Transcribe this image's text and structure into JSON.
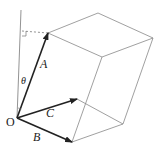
{
  "diagram": {
    "title": "",
    "colors": {
      "edge": "#888888",
      "vector": "#222222",
      "axis": "#777777",
      "background": "#ffffff"
    },
    "labels": {
      "origin": "O",
      "vector_a": "A",
      "vector_b": "B",
      "vector_c": "C",
      "angle": "θ"
    },
    "points": {
      "O": [
        17,
        118
      ],
      "A_tip": [
        48,
        33
      ],
      "B_tip": [
        72,
        142
      ],
      "C_tip": [
        77,
        99
      ],
      "top_back": [
        98,
        13
      ],
      "right": [
        153,
        38
      ],
      "front_top": [
        102,
        57
      ],
      "lower_right": [
        123,
        124
      ],
      "axis_top": [
        21,
        10
      ],
      "perp_foot": [
        22,
        31
      ]
    },
    "vectors": [
      {
        "name": "A",
        "from": "O",
        "to": "A_tip"
      },
      {
        "name": "B",
        "from": "O",
        "to": "B_tip"
      },
      {
        "name": "C",
        "from": "O",
        "to": "C_tip"
      }
    ]
  }
}
